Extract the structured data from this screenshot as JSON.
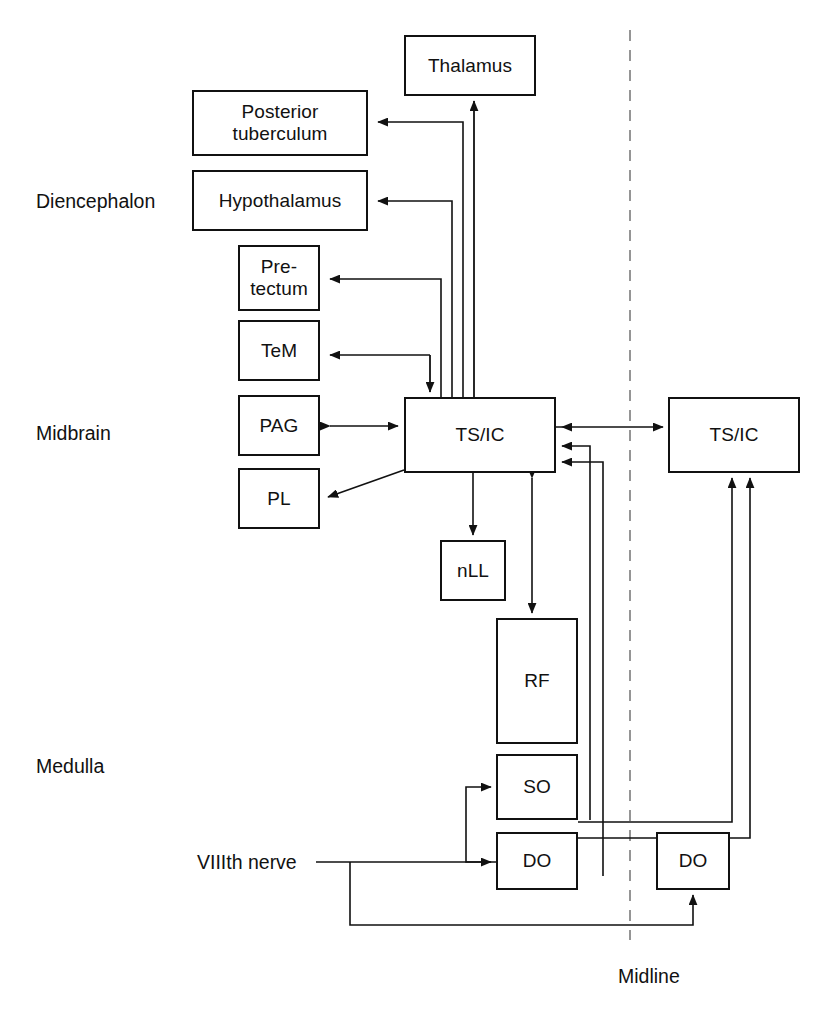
{
  "figure": {
    "domain": "diagram",
    "type": "schematic-block-diagram",
    "background_color": "#ffffff",
    "line_color": "#111111",
    "text_color": "#111111"
  },
  "region_labels": [
    {
      "id": "diencephalon",
      "text": "Diencephalon",
      "x": 36,
      "y": 190
    },
    {
      "id": "midbrain",
      "text": "Midbrain",
      "x": 36,
      "y": 422
    },
    {
      "id": "medulla",
      "text": "Medulla",
      "x": 36,
      "y": 755
    }
  ],
  "nodes": [
    {
      "id": "thalamus",
      "label": "Thalamus",
      "lines": [
        "Thalamus"
      ],
      "x": 404,
      "y": 35,
      "w": 132,
      "h": 61,
      "side": "ipsilateral"
    },
    {
      "id": "posterior-tuberculum",
      "label": "Posterior tuberculum",
      "lines": [
        "Posterior",
        "tuberculum"
      ],
      "x": 192,
      "y": 90,
      "w": 176,
      "h": 66,
      "side": "ipsilateral"
    },
    {
      "id": "hypothalamus",
      "label": "Hypothalamus",
      "lines": [
        "Hypothalamus"
      ],
      "x": 192,
      "y": 170,
      "w": 176,
      "h": 61,
      "side": "ipsilateral"
    },
    {
      "id": "pretectum",
      "label": "Pre-tectum",
      "lines": [
        "Pre-",
        "tectum"
      ],
      "x": 238,
      "y": 245,
      "w": 82,
      "h": 66,
      "side": "ipsilateral"
    },
    {
      "id": "tem",
      "label": "TeM",
      "lines": [
        "TeM"
      ],
      "x": 238,
      "y": 320,
      "w": 82,
      "h": 61,
      "side": "ipsilateral"
    },
    {
      "id": "pag",
      "label": "PAG",
      "lines": [
        "PAG"
      ],
      "x": 238,
      "y": 395,
      "w": 82,
      "h": 61,
      "side": "ipsilateral"
    },
    {
      "id": "pl",
      "label": "PL",
      "lines": [
        "PL"
      ],
      "x": 238,
      "y": 468,
      "w": 82,
      "h": 61,
      "side": "ipsilateral"
    },
    {
      "id": "tsic-left",
      "label": "TS/IC",
      "lines": [
        "TS/IC"
      ],
      "x": 404,
      "y": 397,
      "w": 152,
      "h": 76,
      "side": "ipsilateral"
    },
    {
      "id": "tsic-right",
      "label": "TS/IC",
      "lines": [
        "TS/IC"
      ],
      "x": 668,
      "y": 397,
      "w": 132,
      "h": 76,
      "side": "contralateral"
    },
    {
      "id": "nll",
      "label": "nLL",
      "lines": [
        "nLL"
      ],
      "x": 440,
      "y": 540,
      "w": 66,
      "h": 61,
      "side": "ipsilateral"
    },
    {
      "id": "rf",
      "label": "RF",
      "lines": [
        "RF"
      ],
      "x": 496,
      "y": 618,
      "w": 82,
      "h": 126,
      "side": "ipsilateral"
    },
    {
      "id": "so",
      "label": "SO",
      "lines": [
        "SO"
      ],
      "x": 496,
      "y": 754,
      "w": 82,
      "h": 66,
      "side": "ipsilateral"
    },
    {
      "id": "do-left",
      "label": "DO",
      "lines": [
        "DO"
      ],
      "x": 496,
      "y": 832,
      "w": 82,
      "h": 58,
      "side": "ipsilateral"
    },
    {
      "id": "do-right",
      "label": "DO",
      "lines": [
        "DO"
      ],
      "x": 656,
      "y": 832,
      "w": 74,
      "h": 58,
      "side": "contralateral"
    }
  ],
  "input_label": {
    "id": "viiith-nerve",
    "text": "VIIIth nerve",
    "x": 197,
    "y": 862
  },
  "midline": {
    "label": "Midline",
    "label_x": 618,
    "label_y": 976,
    "x": 630,
    "y_top": 30,
    "y_bottom": 940,
    "style": "dashed",
    "color": "#8a8a8a"
  },
  "connections": [
    {
      "id": "tsic-to-thalamus",
      "from": "tsic-left",
      "to": "thalamus",
      "direction": "unidirectional"
    },
    {
      "id": "tsic-to-posterior-tuberculum",
      "from": "tsic-left",
      "to": "posterior-tuberculum",
      "direction": "unidirectional"
    },
    {
      "id": "tsic-to-hypothalamus",
      "from": "tsic-left",
      "to": "hypothalamus",
      "direction": "unidirectional"
    },
    {
      "id": "tsic-to-pretectum",
      "from": "tsic-left",
      "to": "pretectum",
      "direction": "unidirectional"
    },
    {
      "id": "tsic-to-tem",
      "from": "tsic-left",
      "to": "tem",
      "direction": "unidirectional"
    },
    {
      "id": "tsic-pag-reciprocal",
      "from": "tsic-left",
      "to": "pag",
      "direction": "bidirectional"
    },
    {
      "id": "tsic-to-pl",
      "from": "tsic-left",
      "to": "pl",
      "direction": "unidirectional"
    },
    {
      "id": "tsic-to-nll",
      "from": "tsic-left",
      "to": "nll",
      "direction": "unidirectional"
    },
    {
      "id": "tsic-rf-reciprocal",
      "from": "tsic-left",
      "to": "rf",
      "direction": "bidirectional"
    },
    {
      "id": "tsic-left-to-tsic-right",
      "from": "tsic-left",
      "to": "tsic-right",
      "direction": "unidirectional"
    },
    {
      "id": "so-to-tsic-left",
      "from": "so",
      "to": "tsic-left",
      "direction": "unidirectional"
    },
    {
      "id": "do-left-to-tsic-left",
      "from": "do-left",
      "to": "tsic-left",
      "direction": "unidirectional"
    },
    {
      "id": "so-to-tsic-right",
      "from": "so",
      "to": "tsic-right",
      "direction": "unidirectional"
    },
    {
      "id": "do-left-to-tsic-right",
      "from": "do-left",
      "to": "tsic-right",
      "direction": "unidirectional"
    },
    {
      "id": "do-left-to-so",
      "from": "do-left",
      "to": "so",
      "direction": "unidirectional"
    },
    {
      "id": "viiith-nerve-to-do-left",
      "from": "viiith-nerve",
      "to": "do-left",
      "direction": "unidirectional"
    },
    {
      "id": "viiith-nerve-to-do-right",
      "from": "viiith-nerve",
      "to": "do-right",
      "direction": "unidirectional"
    }
  ]
}
